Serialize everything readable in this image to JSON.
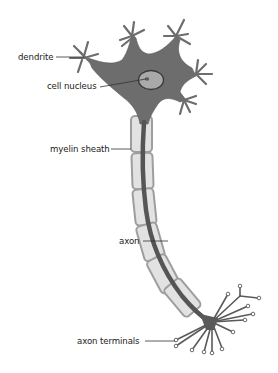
{
  "diagram": {
    "type": "neuron",
    "colors": {
      "cell_body": "#6d6d6d",
      "cell_body_outline": "#5a5a5a",
      "nucleus_fill": "#a9a9a9",
      "nucleus_outline": "#3a3a3a",
      "axon": "#555555",
      "myelin_fill": "#e2e2e2",
      "myelin_outline": "#9e9e9e",
      "terminal_bulb": "#ffffff",
      "label_text": "#222222",
      "leader_line": "#333333",
      "background": "#ffffff"
    },
    "labels": [
      {
        "id": "dendrite",
        "text": "dendrite"
      },
      {
        "id": "cell-nucleus",
        "text": "cell nucleus"
      },
      {
        "id": "myelin-sheath",
        "text": "myelin sheath"
      },
      {
        "id": "axon",
        "text": "axon"
      },
      {
        "id": "axon-terminals",
        "text": "axon terminals"
      }
    ]
  }
}
